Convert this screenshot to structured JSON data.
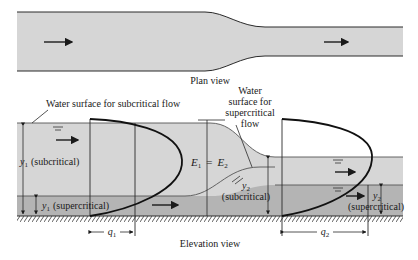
{
  "plan_view": {
    "caption": "Plan view",
    "flow_direction": "left-to-right"
  },
  "elevation_view": {
    "caption": "Elevation view",
    "labels": {
      "subcritical_surface": "Water surface for subcritical flow",
      "supercritical_surface_line1": "Water",
      "supercritical_surface_line2": "surface for",
      "supercritical_surface_line3": "supercritical",
      "supercritical_surface_line4": "flow",
      "y1_sub_sym": "y",
      "y1_sub_sub": "1",
      "y1_sub_text": "(subcritical)",
      "y1_super_sym": "y",
      "y1_super_sub": "1",
      "y1_super_text": "(supercritical)",
      "energy_E1": "E",
      "energy_E1_sub": "1",
      "energy_eq": "=",
      "energy_E2": "E",
      "energy_E2_sub": "2",
      "y2_sub_sym": "y",
      "y2_sub_sub": "2",
      "y2_sub_text": "(subcritical)",
      "y2_super_sym": "y",
      "y2_super_sub": "2",
      "y2_super_text": "(supercritical)",
      "q1_sym": "q",
      "q1_sub": "1",
      "q2_sym": "q",
      "q2_sub": "2"
    }
  },
  "colors": {
    "water_light": "#d6d6d6",
    "water_dark": "#b4b4b4",
    "line": "#2a2a2a",
    "background": "#ffffff"
  }
}
